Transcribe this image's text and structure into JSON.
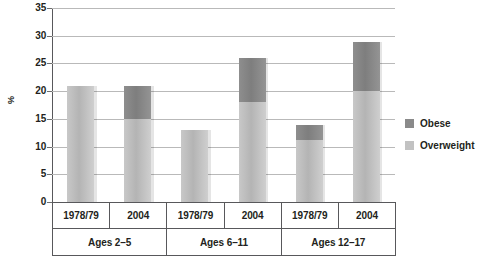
{
  "chart_data": {
    "type": "bar",
    "stacked": true,
    "title": "",
    "xlabel": "",
    "ylabel": "%",
    "ylim": [
      0,
      35
    ],
    "yticks": [
      35,
      30,
      25,
      20,
      15,
      10,
      5,
      0
    ],
    "grid": true,
    "legend_position": "right",
    "categories": [
      "1978/79",
      "2004",
      "1978/79",
      "2004",
      "1978/79",
      "2004"
    ],
    "groups": [
      {
        "label": "Ages 2–5",
        "categories": [
          "1978/79",
          "2004"
        ]
      },
      {
        "label": "Ages 6–11",
        "categories": [
          "1978/79",
          "2004"
        ]
      },
      {
        "label": "Ages 12–17",
        "categories": [
          "1978/79",
          "2004"
        ]
      }
    ],
    "series": [
      {
        "name": "Overweight",
        "color": "#c2c2c2",
        "values": [
          21.0,
          15.0,
          13.0,
          18.0,
          11.2,
          20.0
        ]
      },
      {
        "name": "Obese",
        "color": "#8a8a8a",
        "values": [
          0.0,
          6.0,
          0.0,
          8.0,
          2.7,
          8.8
        ]
      }
    ],
    "totals": [
      21.0,
      21.0,
      13.0,
      26.0,
      13.9,
      28.8
    ]
  },
  "legend": {
    "items": [
      {
        "label": "Obese",
        "color": "#8a8a8a"
      },
      {
        "label": "Overweight",
        "color": "#c2c2c2"
      }
    ]
  },
  "caption": {
    "text": ""
  }
}
